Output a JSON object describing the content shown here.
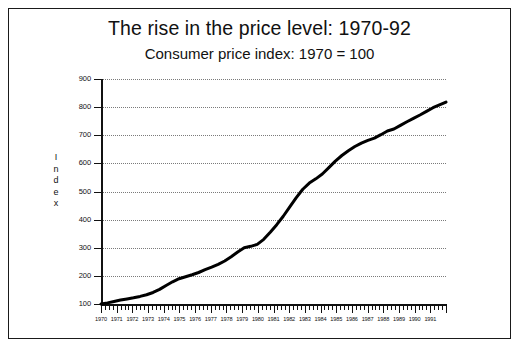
{
  "chart_data": {
    "type": "line",
    "title": "The rise in the price level: 1970-92",
    "subtitle": "Consumer price index: 1970 = 100",
    "xlabel": "",
    "ylabel": "Index",
    "ylim": [
      100,
      900
    ],
    "ytick_values": [
      100,
      200,
      300,
      400,
      500,
      600,
      700,
      800,
      900
    ],
    "ytick_labels": [
      "100",
      "200",
      "300",
      "400",
      "500",
      "600",
      "700",
      "800",
      "900"
    ],
    "grid": true,
    "grid_style": "dotted-horizontal",
    "legend": "none",
    "line_color": "#000000",
    "line_width_px": 3,
    "xlim": [
      1970,
      1992
    ],
    "xtick_labels": [
      "1970",
      "1971",
      "1972",
      "1973",
      "1974",
      "1975",
      "1976",
      "1977",
      "1978",
      "1979",
      "1980",
      "1981",
      "1982",
      "1983",
      "1984",
      "1985",
      "1986",
      "1987",
      "1988",
      "1989",
      "1990",
      "1991"
    ],
    "minor_ticks_per_year": 4,
    "x": [
      1970.0,
      1970.5,
      1971.0,
      1971.5,
      1972.0,
      1972.5,
      1973.0,
      1973.5,
      1974.0,
      1974.5,
      1975.0,
      1975.5,
      1976.0,
      1976.5,
      1977.0,
      1977.5,
      1978.0,
      1978.5,
      1979.0,
      1979.5,
      1980.0,
      1980.5,
      1981.0,
      1981.5,
      1982.0,
      1982.5,
      1983.0,
      1983.5,
      1984.0,
      1984.5,
      1985.0,
      1985.5,
      1986.0,
      1986.5,
      1987.0,
      1987.5,
      1988.0,
      1988.5,
      1989.0,
      1989.5,
      1990.0,
      1990.5,
      1991.0,
      1991.5,
      1992.0
    ],
    "values": [
      100,
      104,
      109,
      114,
      118,
      122,
      127,
      133,
      141,
      152,
      166,
      179,
      190,
      197,
      204,
      212,
      222,
      231,
      241,
      253,
      268,
      285,
      300,
      305,
      312,
      330,
      355,
      382,
      412,
      445,
      478,
      508,
      530,
      545,
      562,
      585,
      608,
      628,
      645,
      660,
      672,
      682,
      690,
      702,
      715
    ],
    "series_note_values_tail": [
      722,
      735,
      748,
      760,
      772,
      785,
      798,
      808,
      818
    ],
    "end_value": 820
  },
  "annotations": {
    "y_axis_title_letters": [
      "I",
      "n",
      "d",
      "e",
      "x"
    ]
  }
}
